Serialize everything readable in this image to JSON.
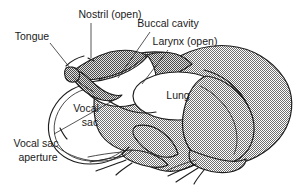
{
  "figure": {
    "view": "lateral sagittal section",
    "background_color": "#ffffff",
    "ink_color": "#1d1d1d",
    "body_fill_color": "#b0b0b0",
    "label_color": "#1a1a1a"
  },
  "labels": [
    {
      "id": "tongue",
      "text": "Tongue",
      "x": 32,
      "y": 37,
      "anchor": "mid"
    },
    {
      "id": "nostril",
      "text": "Nostril (open)",
      "x": 110,
      "y": 15,
      "anchor": "mid"
    },
    {
      "id": "buccal_cavity",
      "text": "Buccal cavity",
      "x": 168,
      "y": 24,
      "anchor": "mid"
    },
    {
      "id": "larynx",
      "text": "Larynx (open)",
      "x": 185,
      "y": 42,
      "anchor": "mid"
    },
    {
      "id": "lung",
      "text": "Lung",
      "x": 178,
      "y": 96,
      "anchor": "mid"
    },
    {
      "id": "vocal_sac",
      "text": "Vocal",
      "x": 86,
      "y": 109,
      "anchor": "mid"
    },
    {
      "id": "vocal_sac_2",
      "text": "sac",
      "x": 90,
      "y": 123,
      "anchor": "mid"
    },
    {
      "id": "vocal_sac_ap",
      "text": "Vocal sac",
      "x": 36,
      "y": 144,
      "anchor": "mid"
    },
    {
      "id": "vocal_sac_ap_2",
      "text": "aperture",
      "x": 38,
      "y": 158,
      "anchor": "mid"
    }
  ],
  "anatomy_parts": [
    "tongue",
    "nostril",
    "buccal cavity",
    "larynx",
    "lung",
    "vocal sac",
    "vocal sac aperture"
  ]
}
